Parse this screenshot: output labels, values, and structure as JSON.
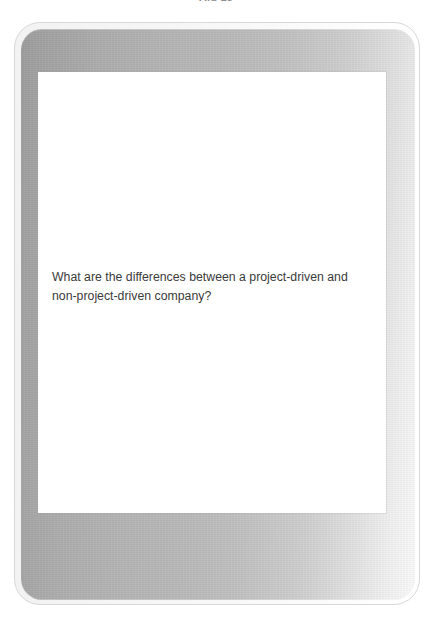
{
  "page": {
    "caption": "Aid 13",
    "background_color": "#ffffff"
  },
  "device": {
    "name": "tablet-frame",
    "bezel_color_left": "#9d9d9d",
    "bezel_color_right": "#fafafa",
    "outer_ring_color": "#d8d8d8"
  },
  "screen": {
    "background_color": "#ffffff",
    "text_color": "#3b3b3b",
    "question": {
      "full_text": "What are the differences between a project-driven and non-project-driven company?",
      "lines": [
        "What are the differences between a project-driven and",
        "non-project-driven company?"
      ]
    }
  }
}
